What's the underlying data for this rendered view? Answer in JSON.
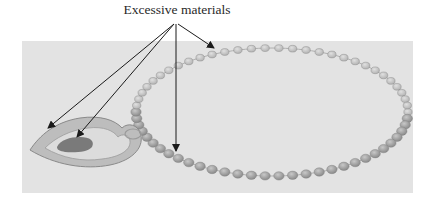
{
  "figure": {
    "annotation_label": "Excessive materials",
    "colors": {
      "background": "#ffffff",
      "panel": "#e3e3e3",
      "beads": "#9a9a9a",
      "arrow": "#1a1a1a"
    },
    "arrows": [
      {
        "target": "pendant-outer-edge"
      },
      {
        "target": "pendant-inner-blob"
      },
      {
        "target": "necklace-front-beads"
      },
      {
        "target": "necklace-back-beads"
      }
    ]
  }
}
